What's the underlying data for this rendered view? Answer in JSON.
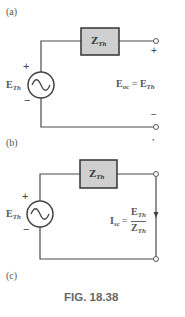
{
  "figure": {
    "caption": "FIG. 18.38",
    "colors": {
      "wire": "#4a4a4a",
      "box_fill": "#cfcfcf",
      "box_stroke": "#333333",
      "text": "#555555"
    }
  },
  "panels": [
    {
      "label": "(a)",
      "impedance": {
        "main": "Z",
        "sub": "Th"
      },
      "source": {
        "main": "E",
        "sub": "Th",
        "plus": "+",
        "minus": "−",
        "icon": "ac-source-icon"
      },
      "terminal_top_sign": "+",
      "terminal_bottom_sign": "−",
      "equation": {
        "lhs_main": "E",
        "lhs_sub": "oc",
        "eq": "=",
        "rhs_main": "E",
        "rhs_sub": "Th"
      }
    },
    {
      "label": "(b)",
      "impedance": {
        "main": "Z",
        "sub": "Th"
      },
      "source": {
        "main": "E",
        "sub": "Th",
        "plus": "+",
        "minus": "−",
        "icon": "ac-source-icon"
      },
      "equation": {
        "lhs_main": "I",
        "lhs_sub": "sc",
        "eq": "=",
        "num_main": "E",
        "num_sub": "Th",
        "den_main": "Z",
        "den_sub": "Th"
      }
    }
  ],
  "panel_c_label": "(c)",
  "stray_mark": "•"
}
